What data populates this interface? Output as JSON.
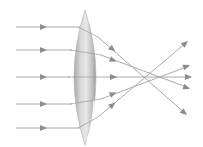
{
  "diagram": {
    "type": "optics-convex-lens",
    "colors": {
      "background": "#ffffff",
      "ray": "#9a9a9a",
      "arrow": "#8c8c8c",
      "lens_light": "#e6e6e6",
      "lens_mid": "#c4c4c4",
      "lens_dark": "#9e9e9e",
      "highlight": "#ffffff"
    },
    "lens": {
      "cx": 85,
      "top": 10,
      "bottom": 145,
      "half_width": 18
    },
    "incoming_rays": [
      {
        "y": 27,
        "arrow_x": 43
      },
      {
        "y": 50,
        "arrow_x": 43
      },
      {
        "y": 77,
        "arrow_x": 43
      },
      {
        "y": 104,
        "arrow_x": 43
      },
      {
        "y": 128,
        "arrow_x": 43
      }
    ],
    "outgoing_rays": [
      {
        "from": [
          78,
          27
        ],
        "arrow": [
          117,
          48
        ],
        "to": [
          186,
          114
        ]
      },
      {
        "from": [
          70,
          50
        ],
        "arrow": [
          117,
          59
        ],
        "to": [
          189,
          88
        ]
      },
      {
        "from": [
          68,
          77
        ],
        "arrow": [
          117,
          77
        ],
        "to": [
          191,
          77
        ]
      },
      {
        "from": [
          70,
          104
        ],
        "arrow": [
          117,
          95
        ],
        "to": [
          189,
          66
        ]
      },
      {
        "from": [
          78,
          128
        ],
        "arrow": [
          117,
          106
        ],
        "to": [
          187,
          42
        ]
      }
    ]
  }
}
